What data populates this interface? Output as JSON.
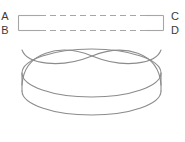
{
  "figure": {
    "background_color": "#ffffff",
    "line_color": "#8c8c8c",
    "dashed_line_color": "#a6a6a6",
    "label_color": "#3a3a3a",
    "strip": {
      "name": "rectangular-strip",
      "labels": {
        "top_left": "A",
        "bottom_left": "B",
        "top_right": "C",
        "bottom_right": "D"
      },
      "top_edge_style": "dashed",
      "bottom_edge_style": "dashed",
      "left_edge_style": "solid",
      "right_edge_style": "solid"
    },
    "solid": {
      "name": "cylinder-with-crossing-arcs",
      "shape": "cylinder",
      "top_face": "ellipse",
      "bottom_face": "ellipse",
      "arc_count": 2,
      "arcs_cross": true,
      "crossing_point": "center-top"
    }
  }
}
